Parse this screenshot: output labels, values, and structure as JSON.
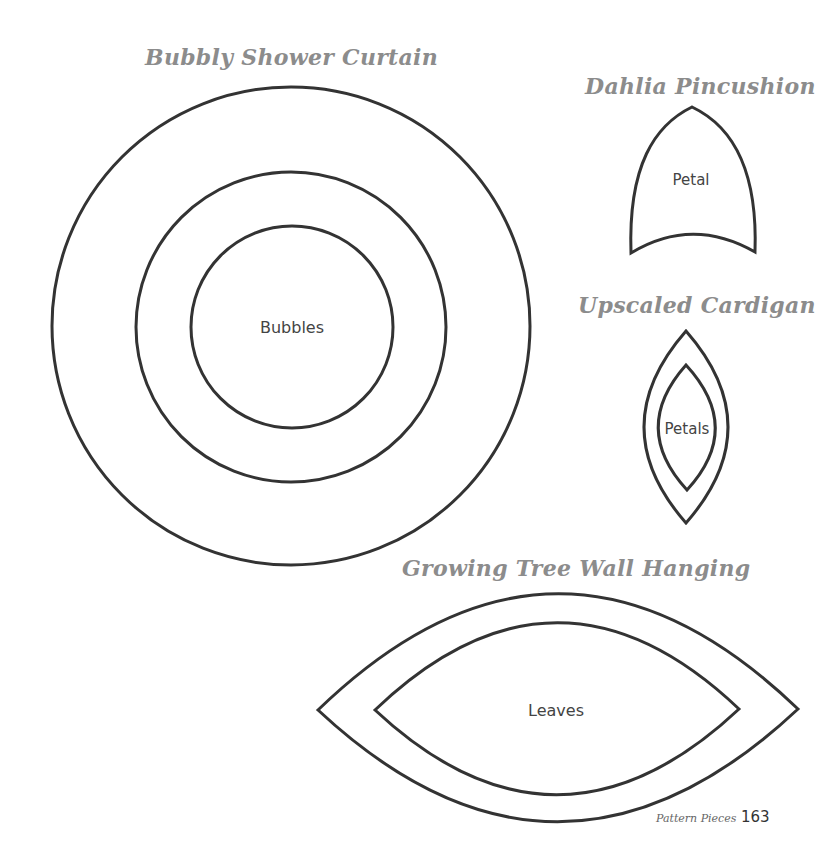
{
  "colors": {
    "background": "#ffffff",
    "outline": "#333333",
    "title": "#8c8c8c",
    "label": "#444444"
  },
  "sections": [
    {
      "title": "Bubbly Shower Curtain",
      "pieces": [
        {
          "label": "Bubbles",
          "shape": "concentric-circles",
          "count": 3
        }
      ]
    },
    {
      "title": "Dahlia Pincushion",
      "pieces": [
        {
          "label": "Petal",
          "shape": "pointed-arch"
        }
      ]
    },
    {
      "title": "Upscaled Cardigan",
      "pieces": [
        {
          "label": "Petals",
          "shape": "nested-vertical-petals",
          "count": 2
        }
      ]
    },
    {
      "title": "Growing Tree Wall Hanging",
      "pieces": [
        {
          "label": "Leaves",
          "shape": "nested-horizontal-leaves",
          "count": 2
        }
      ]
    }
  ],
  "footer": {
    "section_name": "Pattern Pieces",
    "page_number": "163"
  }
}
